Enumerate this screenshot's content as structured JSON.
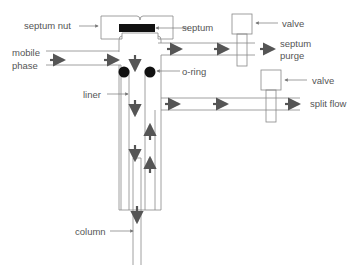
{
  "diagram": {
    "labels": {
      "septum_nut": "septum nut",
      "septum": "septum",
      "valve_top": "valve",
      "septum_purge_1": "septum",
      "septum_purge_2": "purge",
      "mobile_phase_1": "mobile",
      "mobile_phase_2": "phase",
      "o_ring": "o-ring",
      "liner": "liner",
      "valve_bottom": "valve",
      "split_flow": "split flow",
      "column": "column"
    },
    "colors": {
      "line": "#777777",
      "arrow": "#555555",
      "fill_dark": "#111111",
      "text": "#555555"
    }
  }
}
